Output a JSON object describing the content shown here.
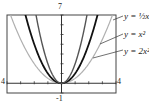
{
  "chart_data": {
    "type": "line",
    "title": "",
    "xlabel": "",
    "ylabel": "",
    "xlim": [
      -4,
      4
    ],
    "ylim": [
      -1,
      7
    ],
    "grid": false,
    "window_labels": {
      "top": "7",
      "bottom": "-1",
      "left": "4",
      "right": "4"
    },
    "series": [
      {
        "name": "y = 1/2 x",
        "label": "y = ½x",
        "coef": 0.5,
        "color": "#b0b0b0",
        "width": 1.2
      },
      {
        "name": "y = x^2",
        "label": "y = x²",
        "coef": 1,
        "color": "#111111",
        "width": 1.8
      },
      {
        "name": "y = 2x^2",
        "label": "y = 2x²",
        "coef": 2,
        "color": "#555555",
        "width": 1.4
      }
    ]
  },
  "colors": {
    "frame": "#333333",
    "axis": "#333333"
  }
}
